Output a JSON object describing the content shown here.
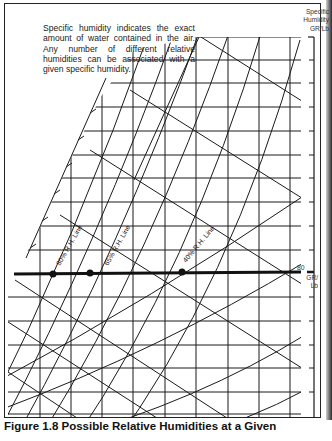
{
  "note": {
    "text": "Specific humidity indicates the exact amount of water contained in the air. Any number of different relative humidities can be associated with a given specific humidity."
  },
  "axis": {
    "title": "Specific Humidity GR/Lb",
    "title_lines": [
      "Specific",
      "Humidity",
      "GR/Lb"
    ],
    "marker_value": "80",
    "marker_unit_lines": [
      "GR/",
      "Lb"
    ]
  },
  "rh_lines": [
    {
      "label": "80% R.H. Line",
      "point_x": 53
    },
    {
      "label": "65% R.H. Line",
      "point_x": 90
    },
    {
      "label": "40% R.H. Line",
      "point_x": 182
    }
  ],
  "highlight": {
    "specific_humidity": 80,
    "unit": "GR/Lb"
  },
  "caption": {
    "text": "Figure 1.8 Possible Relative Humidities at a Given"
  },
  "colors": {
    "ink": "#1a1a1a",
    "paper": "#ffffff"
  }
}
